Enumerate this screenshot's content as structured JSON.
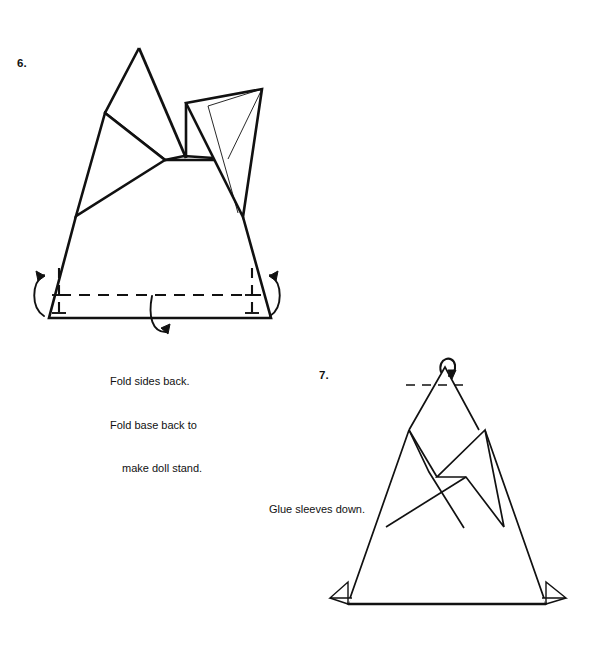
{
  "page": {
    "background_color": "#ffffff",
    "ink_color": "#111111",
    "width": 597,
    "height": 658
  },
  "steps": [
    {
      "id": "step-6",
      "number": "6.",
      "caption_lines": [
        "Fold sides back.",
        "Fold base back to",
        "make doll stand."
      ],
      "caption_text": "Fold sides back. Fold base back to make doll stand.",
      "fold_marks": [
        "left-side-fold-arrow",
        "right-side-fold-arrow",
        "base-fold-arrow"
      ],
      "fold_line_style": "dashed"
    },
    {
      "id": "step-7",
      "number": "7.",
      "caption_lines": [
        "Glue sleeves down."
      ],
      "caption_text": "Glue sleeves down.",
      "fold_marks": [
        "head-fold-arrow"
      ],
      "fold_line_style": "dashed"
    }
  ]
}
